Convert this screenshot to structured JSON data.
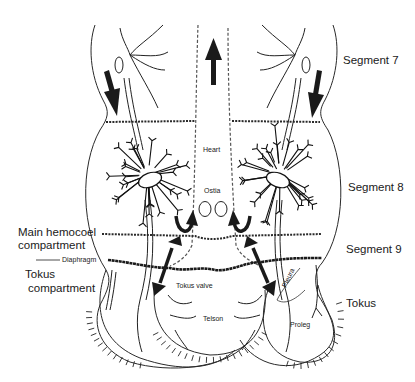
{
  "figure": {
    "labels": {
      "segment_7": "Segment 7",
      "segment_8": "Segment 8",
      "segment_9": "Segment 9",
      "tokus": "Tokus",
      "main_hemocoel_line1": "Main hemocoel",
      "main_hemocoel_line2": "compartment",
      "tokus_compartment_line1": "Tokus",
      "tokus_compartment_line2": "compartment",
      "diaphragm": "Diaphragm",
      "heart": "Heart",
      "ostia": "Ostia",
      "tokus_valve": "Tokus valve",
      "telson": "Telson",
      "pleura": "Pleura",
      "proleg": "Proleg"
    },
    "arrows": [
      {
        "name": "heart-flow-anterior",
        "direction": "up"
      },
      {
        "name": "left-lateral-flow",
        "direction": "down"
      },
      {
        "name": "right-lateral-flow",
        "direction": "down"
      },
      {
        "name": "left-ostia-inflow",
        "direction": "u-turn-into-heart"
      },
      {
        "name": "right-ostia-inflow",
        "direction": "u-turn-into-heart"
      },
      {
        "name": "left-tokus-exchange",
        "direction": "bidirectional"
      },
      {
        "name": "right-tokus-exchange",
        "direction": "bidirectional"
      }
    ]
  }
}
